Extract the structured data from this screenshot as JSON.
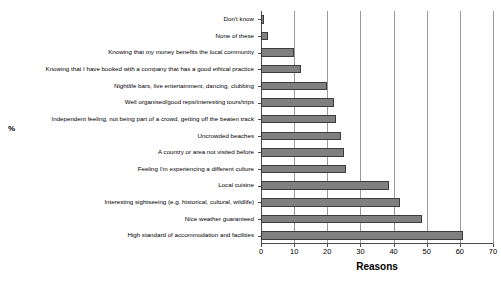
{
  "chart_data": {
    "type": "bar",
    "orientation": "horizontal",
    "title": "",
    "xlabel": "Reasons",
    "ylabel": "%",
    "xlim": [
      0,
      70
    ],
    "xticks": [
      0,
      10,
      20,
      30,
      40,
      50,
      60,
      70
    ],
    "grid": true,
    "legend": "none",
    "bar_color": "#808080",
    "bar_border_color": "#3c3c3c",
    "categories": [
      "Don't know",
      "None of these",
      "Knowing that my money benefits the local community",
      "Knowing that I have booked with a company that has a good ethical practice",
      "Nightlife bars, live entertainment, dancing, clubbing",
      "Well organised/good reps/interesting tours/trips",
      "Independent feeling, not being part of a crowd, getting off the beaten track",
      "Uncrowded beaches",
      "A country or area not visited before",
      "Feeling I'm experiencing a different culture",
      "Local cuisine",
      "Interesting sightseeing (e.g. historical, cultural, wildlife)",
      "Nice weather guaranteed",
      "High standard of accommodation and facilities"
    ],
    "values": [
      1,
      2,
      10,
      12,
      20,
      22,
      22.5,
      24,
      25,
      25.5,
      38.5,
      42,
      48.5,
      61
    ]
  }
}
